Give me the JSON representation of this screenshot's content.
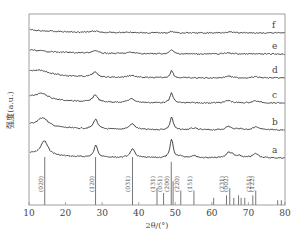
{
  "chart_data": {
    "type": "line",
    "title": "",
    "xlabel": "2θ/(°)",
    "ylabel": "强度(a.u.)",
    "xlim": [
      10,
      80
    ],
    "xticks": [
      10,
      20,
      30,
      40,
      50,
      60,
      70,
      80
    ],
    "grid": false,
    "legend_position": "inline-right",
    "series": [
      {
        "name": "a",
        "baseline": 0.0,
        "peaks": [
          {
            "x": 14.2,
            "h": 3.0,
            "w": 1.2
          },
          {
            "x": 28.3,
            "h": 2.6,
            "w": 0.6
          },
          {
            "x": 38.3,
            "h": 1.8,
            "w": 0.8
          },
          {
            "x": 49.0,
            "h": 4.0,
            "w": 0.5
          },
          {
            "x": 51.5,
            "h": 0.4,
            "w": 0.8
          },
          {
            "x": 55.0,
            "h": 0.5,
            "w": 1.0
          },
          {
            "x": 64.5,
            "h": 1.0,
            "w": 0.8
          },
          {
            "x": 65.5,
            "h": 0.6,
            "w": 0.6
          },
          {
            "x": 67.5,
            "h": 0.4,
            "w": 1.0
          },
          {
            "x": 72.0,
            "h": 0.9,
            "w": 1.0
          }
        ]
      },
      {
        "name": "b",
        "baseline": 0.0,
        "peaks": [
          {
            "x": 13.8,
            "h": 2.0,
            "w": 1.6
          },
          {
            "x": 28.2,
            "h": 2.3,
            "w": 0.7
          },
          {
            "x": 38.2,
            "h": 1.3,
            "w": 1.0
          },
          {
            "x": 49.0,
            "h": 3.0,
            "w": 0.5
          },
          {
            "x": 55.0,
            "h": 0.4,
            "w": 1.0
          },
          {
            "x": 64.5,
            "h": 0.8,
            "w": 0.9
          },
          {
            "x": 67.5,
            "h": 0.3,
            "w": 1.0
          },
          {
            "x": 72.0,
            "h": 0.7,
            "w": 1.0
          }
        ]
      },
      {
        "name": "c",
        "baseline": 0.0,
        "peaks": [
          {
            "x": 13.5,
            "h": 1.5,
            "w": 2.0
          },
          {
            "x": 28.1,
            "h": 1.8,
            "w": 0.8
          },
          {
            "x": 38.0,
            "h": 0.9,
            "w": 1.2
          },
          {
            "x": 49.0,
            "h": 2.5,
            "w": 0.5
          },
          {
            "x": 64.5,
            "h": 0.6,
            "w": 1.0
          },
          {
            "x": 72.0,
            "h": 0.5,
            "w": 1.2
          }
        ]
      },
      {
        "name": "d",
        "baseline": 0.0,
        "peaks": [
          {
            "x": 13.3,
            "h": 1.0,
            "w": 2.5
          },
          {
            "x": 28.0,
            "h": 1.3,
            "w": 0.9
          },
          {
            "x": 38.0,
            "h": 0.6,
            "w": 1.3
          },
          {
            "x": 49.0,
            "h": 2.0,
            "w": 0.5
          },
          {
            "x": 64.5,
            "h": 0.5,
            "w": 1.0
          },
          {
            "x": 72.0,
            "h": 0.3,
            "w": 1.2
          }
        ]
      },
      {
        "name": "e",
        "baseline": 0.0,
        "peaks": [
          {
            "x": 28.0,
            "h": 0.8,
            "w": 1.0
          },
          {
            "x": 38.0,
            "h": 0.4,
            "w": 1.5
          },
          {
            "x": 49.0,
            "h": 1.2,
            "w": 0.6
          },
          {
            "x": 64.5,
            "h": 0.3,
            "w": 1.2
          }
        ]
      },
      {
        "name": "f",
        "baseline": 0.0,
        "peaks": [
          {
            "x": 28.0,
            "h": 0.4,
            "w": 1.2
          },
          {
            "x": 38.0,
            "h": 0.2,
            "w": 1.5
          },
          {
            "x": 49.0,
            "h": 0.5,
            "w": 0.6
          },
          {
            "x": 64.5,
            "h": 0.3,
            "w": 1.5
          }
        ]
      }
    ],
    "reference_lines": [
      {
        "x": 14.3,
        "label": "(020)",
        "h": 1.0
      },
      {
        "x": 28.2,
        "label": "(120)",
        "h": 1.0
      },
      {
        "x": 38.3,
        "label": "(031)",
        "h": 1.0
      },
      {
        "x": 45.0,
        "label": "(131)",
        "h": 0.35
      },
      {
        "x": 46.8,
        "label": "(051)",
        "h": 0.25
      },
      {
        "x": 48.9,
        "label": "(200)",
        "h": 0.9
      },
      {
        "x": 49.4,
        "label": "",
        "h": 0.5
      },
      {
        "x": 51.5,
        "label": "(220)",
        "h": 0.3
      },
      {
        "x": 55.1,
        "label": "(151)",
        "h": 0.3
      },
      {
        "x": 60.5,
        "label": "",
        "h": 0.15
      },
      {
        "x": 64.0,
        "label": "(231)",
        "h": 0.2
      },
      {
        "x": 64.9,
        "label": "(002)",
        "h": 0.35
      },
      {
        "x": 66.0,
        "label": "",
        "h": 0.15
      },
      {
        "x": 67.3,
        "label": "",
        "h": 0.2
      },
      {
        "x": 68.0,
        "label": "",
        "h": 0.15
      },
      {
        "x": 69.0,
        "label": "",
        "h": 0.15
      },
      {
        "x": 71.2,
        "label": "(251)",
        "h": 0.2
      },
      {
        "x": 72.0,
        "label": "(122)",
        "h": 0.3
      },
      {
        "x": 78.0,
        "label": "",
        "h": 0.1
      },
      {
        "x": 79.0,
        "label": "",
        "h": 0.1
      }
    ],
    "curve_labels": [
      "a",
      "b",
      "c",
      "d",
      "e",
      "f"
    ]
  },
  "axis": {
    "xlabel": "2θ/(°)",
    "ylabel": "强度(a.u.)",
    "xticks": [
      "10",
      "20",
      "30",
      "40",
      "50",
      "60",
      "70",
      "80"
    ]
  }
}
